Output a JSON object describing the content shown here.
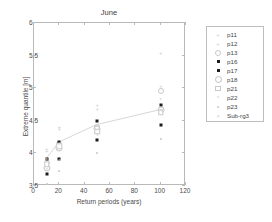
{
  "chart_data": {
    "type": "scatter",
    "title": "June",
    "xlabel": "Return periods (years)",
    "ylabel": "Extreme quantile [m]",
    "xlim": [
      0,
      120
    ],
    "ylim": [
      3.5,
      6
    ],
    "xticks": [
      0,
      20,
      40,
      60,
      80,
      100,
      120
    ],
    "yticks": [
      3.5,
      4,
      4.5,
      5,
      5.5,
      6
    ],
    "xtick_labels": [
      "0",
      "20",
      "40",
      "60",
      "80",
      "100",
      "120"
    ],
    "ytick_labels": [
      "3.5",
      "4",
      "4.5",
      "5",
      "5.5",
      "6"
    ],
    "grid": false,
    "legend_position": "outside right",
    "x": [
      10,
      20,
      50,
      100
    ],
    "series": [
      {
        "name": "p11",
        "marker": "plus",
        "values": [
          4.07,
          4.41,
          4.75,
          5.54
        ]
      },
      {
        "name": "p12",
        "marker": "plus",
        "values": [
          4.04,
          4.37,
          4.68,
          5.03
        ]
      },
      {
        "name": "p13",
        "marker": "circle",
        "values": [
          3.86,
          4.14,
          4.4,
          4.96
        ]
      },
      {
        "name": "p16",
        "marker": "square-fill",
        "values": [
          3.92,
          4.17,
          4.5,
          4.74
        ]
      },
      {
        "name": "p17",
        "marker": "square-fill",
        "values": [
          3.68,
          3.92,
          4.2,
          4.43
        ]
      },
      {
        "name": "p18",
        "marker": "circle-open",
        "values": [
          3.78,
          4.09,
          4.38,
          4.66
        ]
      },
      {
        "name": "p21",
        "marker": "square-open",
        "values": [
          3.83,
          4.11,
          4.33,
          4.63
        ]
      },
      {
        "name": "p22",
        "marker": "star",
        "values": [
          3.74,
          3.88,
          4.26,
          4.82
        ]
      },
      {
        "name": "p23",
        "marker": "dot",
        "values": [
          3.53,
          3.73,
          4.0,
          4.22
        ]
      },
      {
        "name": "Sub-rg3",
        "marker": "x",
        "values": [
          3.9,
          4.15,
          4.42,
          4.65
        ]
      }
    ],
    "trend_line": {
      "name": "Sub-rg3",
      "x": [
        10,
        20,
        50,
        100
      ],
      "y": [
        3.9,
        4.15,
        4.42,
        4.65
      ]
    }
  },
  "legend": {
    "items": [
      {
        "label": "p11",
        "marker": "plus-icon"
      },
      {
        "label": "p12",
        "marker": "plus-icon"
      },
      {
        "label": "p13",
        "marker": "circle-icon"
      },
      {
        "label": "p16",
        "marker": "filled-square-icon"
      },
      {
        "label": "p17",
        "marker": "filled-square-icon"
      },
      {
        "label": "p18",
        "marker": "open-circle-icon"
      },
      {
        "label": "p21",
        "marker": "open-square-icon"
      },
      {
        "label": "p22",
        "marker": "star-icon"
      },
      {
        "label": "p23",
        "marker": "dot-icon"
      },
      {
        "label": "Sub-rg3",
        "marker": "x-icon"
      }
    ]
  },
  "colors": {
    "marker_dark": "#1c1c1c",
    "marker_light": "#c9c9c9",
    "axis": "#b9b9b9",
    "text": "#4a4a4a",
    "background": "#ffffff"
  }
}
